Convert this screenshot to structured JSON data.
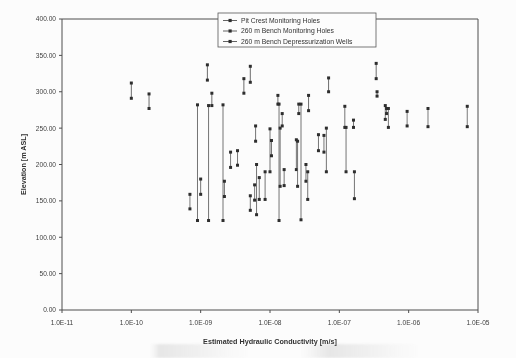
{
  "chart_data": {
    "type": "scatter",
    "title": "",
    "xlabel": "Estimated Hydraulic Conductivity [m/s]",
    "ylabel": "Elevation [m ASL]",
    "xscale": "log",
    "xlim": [
      1e-11,
      1e-05
    ],
    "ylim": [
      0,
      400
    ],
    "grid": false,
    "legend_position": "top-center",
    "xticklabels": [
      "1.0E-11",
      "1.0E-10",
      "1.0E-09",
      "1.0E-08",
      "1.0E-07",
      "1.0E-06",
      "1.0E-05"
    ],
    "xtickvalues": [
      1e-11,
      1e-10,
      1e-09,
      1e-08,
      1e-07,
      1e-06,
      1e-05
    ],
    "yticklabels": [
      "0.00",
      "50.00",
      "100.00",
      "150.00",
      "200.00",
      "250.00",
      "300.00",
      "350.00",
      "400.00"
    ],
    "ytickvalues": [
      0,
      50,
      100,
      150,
      200,
      250,
      300,
      350,
      400
    ],
    "series": [
      {
        "name": "Pit Crest Monitoring Holes",
        "marker": "square",
        "color": "#4f4f4f",
        "segments": [
          {
            "x": 1e-10,
            "y_top": 312,
            "y_bottom": 291
          },
          {
            "x": 1.8e-10,
            "y_top": 297,
            "y_bottom": 277
          },
          {
            "x": 1.25e-09,
            "y_top": 337,
            "y_bottom": 316
          },
          {
            "x": 1.45e-09,
            "y_top": 298,
            "y_bottom": 281
          },
          {
            "x": 4.2e-09,
            "y_top": 318,
            "y_bottom": 298
          },
          {
            "x": 5.2e-09,
            "y_top": 335,
            "y_bottom": 313
          },
          {
            "x": 1.3e-08,
            "y_top": 295,
            "y_bottom": 283
          },
          {
            "x": 2.6e-08,
            "y_top": 283,
            "y_bottom": 270
          },
          {
            "x": 3.6e-08,
            "y_top": 295,
            "y_bottom": 274
          },
          {
            "x": 7e-08,
            "y_top": 319,
            "y_bottom": 300
          },
          {
            "x": 3.4e-07,
            "y_top": 339,
            "y_bottom": 318
          },
          {
            "x": 3.5e-07,
            "y_top": 300,
            "y_bottom": 294
          }
        ]
      },
      {
        "name": "260 m Bench Monitoring Holes",
        "marker": "square",
        "color": "#585858",
        "segments": [
          {
            "x": 9e-10,
            "y_top": 282,
            "y_bottom": 123
          },
          {
            "x": 1e-09,
            "y_top": 180,
            "y_bottom": 159
          },
          {
            "x": 1.3e-09,
            "y_top": 281,
            "y_bottom": 123
          },
          {
            "x": 2.1e-09,
            "y_top": 282,
            "y_bottom": 123
          },
          {
            "x": 2.2e-09,
            "y_top": 177,
            "y_bottom": 156
          },
          {
            "x": 5.2e-09,
            "y_top": 157,
            "y_bottom": 137
          },
          {
            "x": 6.2e-09,
            "y_top": 253,
            "y_bottom": 232
          },
          {
            "x": 6.4e-09,
            "y_top": 200,
            "y_bottom": 131
          },
          {
            "x": 7e-09,
            "y_top": 182,
            "y_bottom": 152
          },
          {
            "x": 8.5e-09,
            "y_top": 190,
            "y_bottom": 152
          },
          {
            "x": 1e-08,
            "y_top": 249,
            "y_bottom": 190
          },
          {
            "x": 1.05e-08,
            "y_top": 233,
            "y_bottom": 212
          },
          {
            "x": 1.35e-08,
            "y_top": 283,
            "y_bottom": 123
          },
          {
            "x": 1.4e-08,
            "y_top": 250,
            "y_bottom": 170
          },
          {
            "x": 1.5e-08,
            "y_top": 270,
            "y_bottom": 253
          },
          {
            "x": 1.6e-08,
            "y_top": 193,
            "y_bottom": 171
          },
          {
            "x": 2.4e-08,
            "y_top": 234,
            "y_bottom": 193
          },
          {
            "x": 2.5e-08,
            "y_top": 232,
            "y_bottom": 170
          },
          {
            "x": 2.8e-08,
            "y_top": 283,
            "y_bottom": 124
          },
          {
            "x": 3.3e-08,
            "y_top": 200,
            "y_bottom": 177
          },
          {
            "x": 3.5e-08,
            "y_top": 190,
            "y_bottom": 152
          },
          {
            "x": 5e-08,
            "y_top": 241,
            "y_bottom": 219
          },
          {
            "x": 6e-08,
            "y_top": 240,
            "y_bottom": 217
          },
          {
            "x": 6.5e-08,
            "y_top": 250,
            "y_bottom": 190
          },
          {
            "x": 1.2e-07,
            "y_top": 280,
            "y_bottom": 251
          },
          {
            "x": 1.25e-07,
            "y_top": 251,
            "y_bottom": 190
          },
          {
            "x": 1.6e-07,
            "y_top": 261,
            "y_bottom": 251
          },
          {
            "x": 1.65e-07,
            "y_top": 190,
            "y_bottom": 153
          }
        ]
      },
      {
        "name": "260 m Bench Depressurization Wells",
        "marker": "square",
        "color": "#606060",
        "segments": [
          {
            "x": 7e-10,
            "y_top": 159,
            "y_bottom": 139
          },
          {
            "x": 2.7e-09,
            "y_top": 217,
            "y_bottom": 196
          },
          {
            "x": 3.4e-09,
            "y_top": 219,
            "y_bottom": 199
          },
          {
            "x": 6e-09,
            "y_top": 172,
            "y_bottom": 151
          },
          {
            "x": 4.6e-07,
            "y_top": 281,
            "y_bottom": 262
          },
          {
            "x": 4.8e-07,
            "y_top": 277,
            "y_bottom": 270
          },
          {
            "x": 5.1e-07,
            "y_top": 277,
            "y_bottom": 251
          },
          {
            "x": 9.5e-07,
            "y_top": 273,
            "y_bottom": 253
          },
          {
            "x": 1.9e-06,
            "y_top": 277,
            "y_bottom": 252
          },
          {
            "x": 7e-06,
            "y_top": 280,
            "y_bottom": 252
          }
        ]
      }
    ]
  },
  "legend": {
    "entries": [
      {
        "label": "Pit Crest Monitoring Holes"
      },
      {
        "label": "260 m Bench Monitoring Holes"
      },
      {
        "label": "260 m Bench Depressurization Wells"
      }
    ]
  }
}
